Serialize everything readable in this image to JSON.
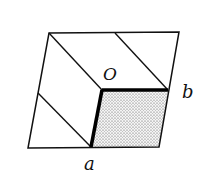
{
  "diagram": {
    "type": "geometric-figure",
    "labels": {
      "origin": "O",
      "edge_b": "b",
      "edge_a": "a"
    },
    "colors": {
      "stroke": "#111111",
      "shade": "#c8c8c8",
      "background": "#ffffff"
    }
  }
}
